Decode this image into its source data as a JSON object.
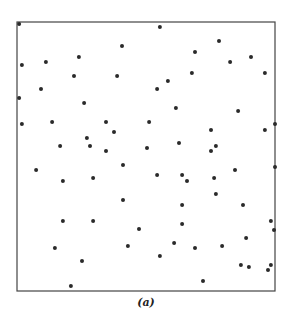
{
  "figure": {
    "caption": "(a)"
  },
  "colors": {
    "frame": "#444444",
    "point": "#2a2a2a",
    "background": "#ffffff"
  },
  "chart_data": {
    "type": "scatter",
    "title": "",
    "xlabel": "",
    "ylabel": "",
    "xlim": [
      0,
      1
    ],
    "ylim": [
      0,
      1
    ],
    "grid": false,
    "axes_ticks": false,
    "legend": "none",
    "series": [
      {
        "name": "points",
        "points": [
          [
            0.008,
            0.993
          ],
          [
            0.554,
            0.981
          ],
          [
            0.783,
            0.929
          ],
          [
            0.407,
            0.911
          ],
          [
            0.69,
            0.888
          ],
          [
            0.24,
            0.87
          ],
          [
            0.907,
            0.87
          ],
          [
            0.112,
            0.851
          ],
          [
            0.826,
            0.851
          ],
          [
            0.019,
            0.84
          ],
          [
            0.678,
            0.81
          ],
          [
            0.961,
            0.81
          ],
          [
            0.221,
            0.799
          ],
          [
            0.388,
            0.799
          ],
          [
            0.585,
            0.781
          ],
          [
            0.093,
            0.751
          ],
          [
            0.543,
            0.751
          ],
          [
            0.008,
            0.717
          ],
          [
            0.26,
            0.699
          ],
          [
            0.616,
            0.68
          ],
          [
            0.857,
            0.669
          ],
          [
            0.019,
            0.621
          ],
          [
            0.136,
            0.628
          ],
          [
            0.345,
            0.628
          ],
          [
            0.512,
            0.628
          ],
          [
            1.0,
            0.621
          ],
          [
            0.376,
            0.591
          ],
          [
            0.752,
            0.599
          ],
          [
            0.961,
            0.599
          ],
          [
            0.271,
            0.569
          ],
          [
            0.628,
            0.55
          ],
          [
            0.167,
            0.539
          ],
          [
            0.283,
            0.539
          ],
          [
            0.771,
            0.539
          ],
          [
            0.504,
            0.532
          ],
          [
            0.345,
            0.52
          ],
          [
            0.752,
            0.52
          ],
          [
            0.411,
            0.468
          ],
          [
            1.0,
            0.461
          ],
          [
            0.074,
            0.45
          ],
          [
            0.845,
            0.45
          ],
          [
            0.543,
            0.431
          ],
          [
            0.64,
            0.431
          ],
          [
            0.295,
            0.42
          ],
          [
            0.764,
            0.42
          ],
          [
            0.178,
            0.409
          ],
          [
            0.659,
            0.409
          ],
          [
            0.771,
            0.361
          ],
          [
            0.411,
            0.338
          ],
          [
            0.64,
            0.32
          ],
          [
            0.876,
            0.32
          ],
          [
            0.178,
            0.26
          ],
          [
            0.295,
            0.26
          ],
          [
            0.984,
            0.26
          ],
          [
            0.64,
            0.249
          ],
          [
            0.473,
            0.23
          ],
          [
            0.996,
            0.227
          ],
          [
            0.888,
            0.197
          ],
          [
            0.609,
            0.178
          ],
          [
            0.43,
            0.167
          ],
          [
            0.795,
            0.167
          ],
          [
            0.147,
            0.16
          ],
          [
            0.69,
            0.16
          ],
          [
            0.554,
            0.13
          ],
          [
            0.252,
            0.112
          ],
          [
            0.868,
            0.097
          ],
          [
            0.984,
            0.097
          ],
          [
            0.899,
            0.089
          ],
          [
            0.973,
            0.078
          ],
          [
            0.721,
            0.037
          ],
          [
            0.209,
            0.019
          ]
        ]
      }
    ]
  }
}
